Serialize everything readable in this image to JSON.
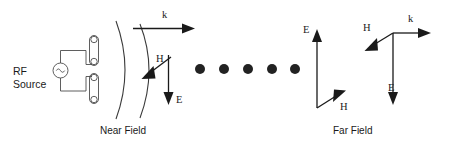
{
  "figure": {
    "background_color": "#ffffff",
    "ink_color": "#1a1a1a",
    "line_color": "#4d4d4d"
  },
  "source": {
    "label_line1": "RF",
    "label_line2": "Source",
    "symbol_name": "ac-source-sine",
    "symbol_glyph": "∿"
  },
  "antenna": {
    "name": "dipole-antenna",
    "element_count": 2,
    "upper_element_name": "dipole-upper-element",
    "lower_element_name": "dipole-lower-element"
  },
  "near_field": {
    "caption": "Near Field",
    "arc_count": 2,
    "vectors": [
      {
        "id": "k",
        "label": "k",
        "direction": "right",
        "name": "near-field-k-vector"
      },
      {
        "id": "H",
        "label": "H",
        "direction": "down-left",
        "name": "near-field-h-vector"
      },
      {
        "id": "E",
        "label": "E",
        "direction": "down",
        "name": "near-field-e-vector"
      }
    ]
  },
  "propagation": {
    "name": "propagation-dots",
    "dot_count": 5,
    "dot_x": [
      200,
      224,
      248,
      272,
      295
    ],
    "dot_y": 69,
    "dot_radius": 5
  },
  "far_field": {
    "caption": "Far Field",
    "axis_sets": [
      {
        "name": "far-field-axes-left",
        "vectors": [
          {
            "id": "E",
            "label": "E",
            "direction": "up",
            "name": "far-field-left-e-vector"
          },
          {
            "id": "H",
            "label": "H",
            "direction": "up-right",
            "name": "far-field-left-h-vector"
          }
        ]
      },
      {
        "name": "far-field-axes-right",
        "vectors": [
          {
            "id": "k",
            "label": "k",
            "direction": "right",
            "name": "far-field-right-k-vector"
          },
          {
            "id": "H",
            "label": "H",
            "direction": "down-left",
            "name": "far-field-right-h-vector"
          },
          {
            "id": "E",
            "label": "E",
            "direction": "down",
            "name": "far-field-right-e-vector"
          }
        ]
      }
    ]
  }
}
